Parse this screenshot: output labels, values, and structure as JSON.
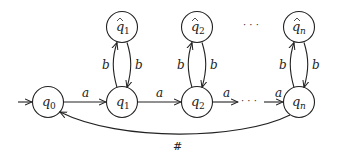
{
  "diagram": {
    "type": "finite-automaton",
    "states": [
      {
        "id": "q0",
        "label": "q",
        "sub": "0",
        "hat": false,
        "x": 48,
        "y": 102,
        "initial": true
      },
      {
        "id": "q1",
        "label": "q",
        "sub": "1",
        "hat": false,
        "x": 122,
        "y": 102
      },
      {
        "id": "q2",
        "label": "q",
        "sub": "2",
        "hat": false,
        "x": 197,
        "y": 102
      },
      {
        "id": "qn",
        "label": "q",
        "sub": "n",
        "hat": false,
        "x": 299,
        "y": 102
      },
      {
        "id": "qh1",
        "label": "q",
        "sub": "1",
        "hat": true,
        "x": 122,
        "y": 27
      },
      {
        "id": "qh2",
        "label": "q",
        "sub": "2",
        "hat": true,
        "x": 197,
        "y": 27
      },
      {
        "id": "qhn",
        "label": "q",
        "sub": "n",
        "hat": true,
        "x": 299,
        "y": 27
      }
    ],
    "transitions": [
      {
        "from": "q0",
        "to": "q1",
        "label": "a"
      },
      {
        "from": "q1",
        "to": "q2",
        "label": "a"
      },
      {
        "from": "q2",
        "to": "...",
        "label": "a"
      },
      {
        "from": "...",
        "to": "qn",
        "label": "a"
      },
      {
        "from": "q1",
        "to": "qh1",
        "label": "b"
      },
      {
        "from": "qh1",
        "to": "q1",
        "label": "b"
      },
      {
        "from": "q2",
        "to": "qh2",
        "label": "b"
      },
      {
        "from": "qh2",
        "to": "q2",
        "label": "b"
      },
      {
        "from": "qn",
        "to": "qhn",
        "label": "b"
      },
      {
        "from": "qhn",
        "to": "qn",
        "label": "b"
      },
      {
        "from": "qn",
        "to": "q0",
        "label": "#"
      }
    ],
    "ellipsis_top": "· · ·",
    "ellipsis_bottom": "· · ·",
    "labels": {
      "a1": "a",
      "a2": "a",
      "a3": "a",
      "a4": "a",
      "b1l": "b",
      "b1r": "b",
      "b2l": "b",
      "b2r": "b",
      "bnl": "b",
      "bnr": "b",
      "hash": "#",
      "q": "q",
      "s0": "0",
      "s1": "1",
      "s2": "2",
      "sn": "n",
      "hat": "^"
    }
  }
}
